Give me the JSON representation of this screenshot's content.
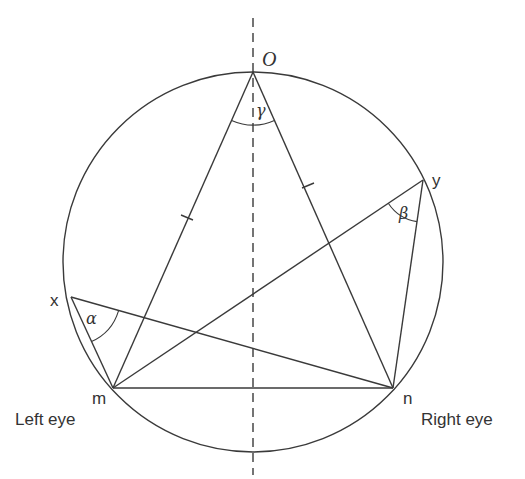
{
  "diagram": {
    "type": "geometry",
    "points": {
      "O": {
        "label": "O"
      },
      "x": {
        "label": "x"
      },
      "y": {
        "label": "y"
      },
      "m": {
        "label": "m"
      },
      "n": {
        "label": "n"
      }
    },
    "angles": {
      "alpha": {
        "label": "α",
        "vertex": "x"
      },
      "beta": {
        "label": "β",
        "vertex": "y"
      },
      "gamma": {
        "label": "γ",
        "vertex": "O"
      }
    },
    "captions": {
      "left_eye": "Left eye",
      "right_eye": "Right eye"
    },
    "segments": [
      "O-m",
      "O-n",
      "m-n",
      "x-m",
      "x-n",
      "y-m",
      "y-n"
    ],
    "equal_marks": [
      "O-m",
      "O-n"
    ],
    "axis": "vertical dashed midline through O"
  }
}
